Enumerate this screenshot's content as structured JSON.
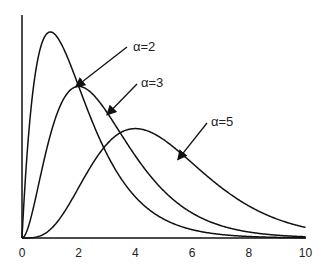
{
  "chart_data": {
    "type": "line",
    "title": "",
    "xlabel": "",
    "ylabel": "",
    "xlim": [
      0,
      10
    ],
    "ylim": [
      0,
      0.4
    ],
    "grid": false,
    "legend": "none (inline arrow annotations)",
    "x_ticks": [
      "0",
      "2",
      "4",
      "6",
      "8",
      "10"
    ],
    "series": [
      {
        "name": "α=2",
        "distribution": "gamma(shape=2, scale=1)",
        "peak": {
          "x": 1,
          "y": 0.368
        }
      },
      {
        "name": "α=3",
        "distribution": "gamma(shape=3, scale=1)",
        "peak": {
          "x": 2,
          "y": 0.271
        }
      },
      {
        "name": "α=5",
        "distribution": "gamma(shape=5, scale=1)",
        "peak": {
          "x": 4,
          "y": 0.195
        }
      }
    ],
    "annotations": [
      {
        "text": "α=2",
        "arrow_to": {
          "x": 1.9,
          "y": 0.27
        }
      },
      {
        "text": "α=3",
        "arrow_to": {
          "x": 3.0,
          "y": 0.22
        }
      },
      {
        "text": "α=5",
        "arrow_to": {
          "x": 5.5,
          "y": 0.14
        }
      }
    ]
  }
}
